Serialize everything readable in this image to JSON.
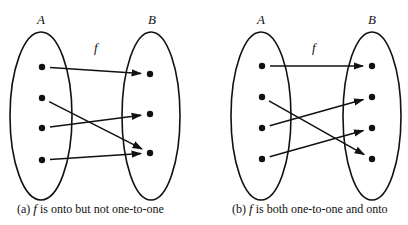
{
  "panels": [
    {
      "id": "a",
      "domain_label": "A",
      "codomain_label": "B",
      "function_label": "f",
      "caption_prefix": "(a)",
      "caption_fn": "f",
      "caption_text": "is onto but not one-to-one",
      "domain_ellipse": {
        "cx": 41,
        "cy": 116,
        "rx": 31,
        "ry": 84
      },
      "codomain_ellipse": {
        "cx": 151,
        "cy": 116,
        "rx": 29,
        "ry": 84
      },
      "domain_points": [
        [
          42,
          67
        ],
        [
          42,
          98
        ],
        [
          42,
          128
        ],
        [
          42,
          160
        ]
      ],
      "codomain_points": [
        [
          150,
          74
        ],
        [
          150,
          114
        ],
        [
          150,
          153
        ]
      ],
      "mapping": [
        [
          0,
          0
        ],
        [
          1,
          2
        ],
        [
          2,
          1
        ],
        [
          3,
          2
        ]
      ]
    },
    {
      "id": "b",
      "domain_label": "A",
      "codomain_label": "B",
      "function_label": "f",
      "caption_prefix": "(b)",
      "caption_fn": "f",
      "caption_text": "is both one-to-one and onto",
      "domain_ellipse": {
        "cx": 261,
        "cy": 116,
        "rx": 30,
        "ry": 84
      },
      "codomain_ellipse": {
        "cx": 372,
        "cy": 116,
        "rx": 29,
        "ry": 84
      },
      "domain_points": [
        [
          262,
          66
        ],
        [
          262,
          97
        ],
        [
          262,
          128
        ],
        [
          262,
          159
        ]
      ],
      "codomain_points": [
        [
          372,
          66
        ],
        [
          372,
          97
        ],
        [
          372,
          128
        ],
        [
          372,
          159
        ]
      ],
      "mapping": [
        [
          0,
          0
        ],
        [
          1,
          3
        ],
        [
          2,
          1
        ],
        [
          3,
          2
        ]
      ]
    }
  ],
  "colors": {
    "stroke": "#111111",
    "background": "#ffffff"
  }
}
